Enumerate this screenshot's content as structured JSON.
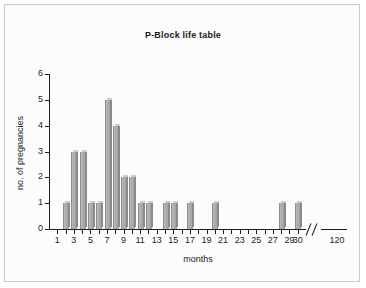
{
  "figure": {
    "title": "P-Block life table",
    "background": "#fcfcfc",
    "border_color": "#c9c9c9",
    "bar_color": "#a9a9a9",
    "axis_color": "#1d1d1d"
  },
  "chart_data": {
    "type": "bar",
    "title": "P-Block life table",
    "xlabel": "months",
    "ylabel": "no. of pregnancies",
    "ylim": [
      0,
      6
    ],
    "yticks": [
      0,
      1,
      2,
      3,
      4,
      5,
      6
    ],
    "xlim": [
      0,
      31
    ],
    "xticks": [
      1,
      2,
      3,
      4,
      5,
      6,
      7,
      8,
      9,
      10,
      11,
      12,
      13,
      14,
      15,
      16,
      17,
      18,
      19,
      20,
      21,
      22,
      23,
      24,
      25,
      26,
      27,
      28,
      29,
      30
    ],
    "xtick_labels": [
      "1",
      "",
      "3",
      "",
      "5",
      "",
      "7",
      "",
      "9",
      "",
      "11",
      "",
      "13",
      "",
      "15",
      "",
      "17",
      "",
      "19",
      "",
      "21",
      "",
      "23",
      "",
      "25",
      "",
      "27",
      "",
      "29",
      "30"
    ],
    "axis_break": true,
    "axis_break_after": 30,
    "extra_xtick_label": "120",
    "grid": false,
    "legend": false,
    "categories": [
      2,
      3,
      4,
      5,
      6,
      7,
      8,
      9,
      10,
      11,
      12,
      14,
      15,
      17,
      20,
      28,
      30
    ],
    "values": [
      1,
      3,
      3,
      1,
      1,
      5,
      4,
      2,
      2,
      1,
      1,
      1,
      1,
      1,
      1,
      1,
      1
    ],
    "bars": [
      {
        "month": 2,
        "value": 1
      },
      {
        "month": 3,
        "value": 3
      },
      {
        "month": 4,
        "value": 3
      },
      {
        "month": 5,
        "value": 1
      },
      {
        "month": 6,
        "value": 1
      },
      {
        "month": 7,
        "value": 5
      },
      {
        "month": 8,
        "value": 4
      },
      {
        "month": 9,
        "value": 2
      },
      {
        "month": 10,
        "value": 2
      },
      {
        "month": 11,
        "value": 1
      },
      {
        "month": 12,
        "value": 1
      },
      {
        "month": 14,
        "value": 1
      },
      {
        "month": 15,
        "value": 1
      },
      {
        "month": 17,
        "value": 1
      },
      {
        "month": 20,
        "value": 1
      },
      {
        "month": 28,
        "value": 1
      },
      {
        "month": 30,
        "value": 1
      }
    ]
  }
}
